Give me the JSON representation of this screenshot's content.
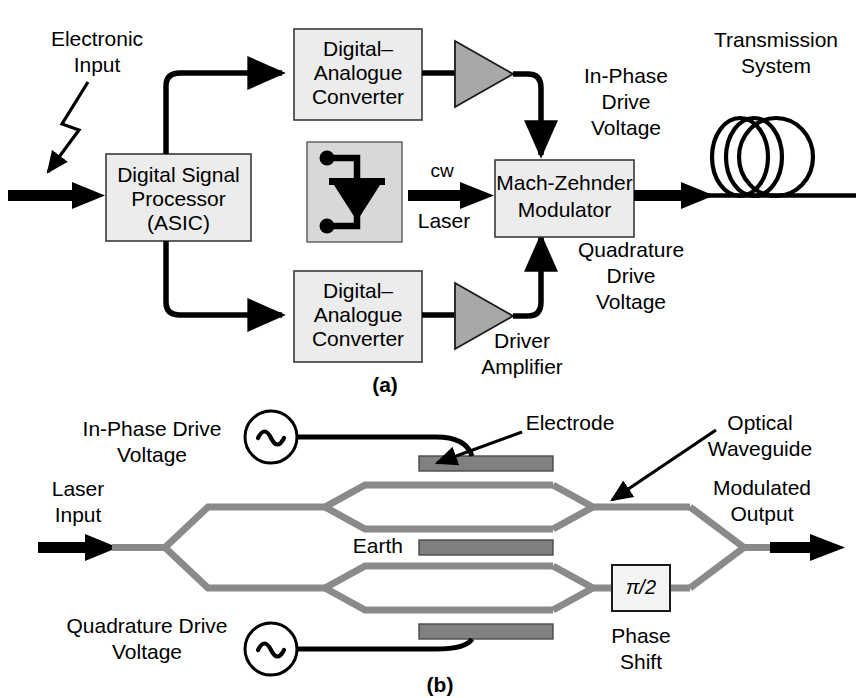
{
  "figure": {
    "panels": [
      {
        "id": "a",
        "label": "(a)"
      },
      {
        "id": "b",
        "label": "(b)"
      }
    ]
  },
  "panel_a": {
    "labels": {
      "electronic_input": [
        "Electronic",
        "Input"
      ],
      "transmission_system": [
        "Transmission",
        "System"
      ],
      "in_phase_drive_voltage": [
        "In-Phase",
        "Drive",
        "Voltage"
      ],
      "quadrature_drive_voltage": [
        "Quadrature",
        "Drive",
        "Voltage"
      ],
      "driver_amplifier": [
        "Driver",
        "Amplifier"
      ],
      "cw_laser": [
        "cw",
        "Laser"
      ]
    },
    "blocks": [
      {
        "name": "digital-signal-processor",
        "lines": [
          "Digital Signal",
          "Processor",
          "(ASIC)"
        ]
      },
      {
        "name": "digital-analogue-converter-upper",
        "lines": [
          "Digital–",
          "Analogue",
          "Converter"
        ]
      },
      {
        "name": "digital-analogue-converter-lower",
        "lines": [
          "Digital–",
          "Analogue",
          "Converter"
        ]
      },
      {
        "name": "mach-zehnder-modulator",
        "lines": [
          "Mach-Zehnder",
          "Modulator"
        ]
      },
      {
        "name": "laser-diode",
        "lines": []
      }
    ]
  },
  "panel_b": {
    "labels": {
      "in_phase_drive_voltage": [
        "In-Phase Drive",
        "Voltage"
      ],
      "quadrature_drive_voltage": [
        "Quadrature  Drive",
        "Voltage"
      ],
      "laser_input": [
        "Laser",
        "Input"
      ],
      "modulated_output": [
        "Modulated",
        "Output"
      ],
      "electrode": "Electrode",
      "optical_waveguide": [
        "Optical",
        "Waveguide"
      ],
      "earth": "Earth",
      "phase_shift": [
        "Phase",
        "Shift"
      ],
      "phase_shift_value": "π/2"
    },
    "sources": [
      {
        "name": "ac-source-in-phase",
        "glyph": "~"
      },
      {
        "name": "ac-source-quadrature",
        "glyph": "~"
      }
    ],
    "electrodes": [
      {
        "name": "electrode-in-phase-drive"
      },
      {
        "name": "electrode-earth"
      },
      {
        "name": "electrode-quadrature-drive"
      }
    ]
  },
  "colors": {
    "ink": "#000000",
    "box_fill": "#ececec",
    "box_stroke": "#3a3a3a",
    "amplifier_fill": "#a8a8a8",
    "laser_box_fill": "#d8d8d8",
    "electrode_fill": "#808080",
    "electrode_stroke": "#4a4a4a",
    "waveguide": "#8a8a8a",
    "phase_box_fill": "#f4f4f4",
    "background": "#ffffff"
  }
}
